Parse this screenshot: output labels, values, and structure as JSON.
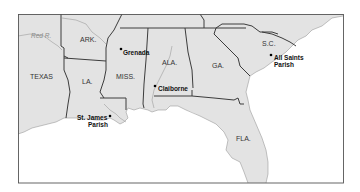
{
  "map": {
    "title": "",
    "states": [
      {
        "label": "TEXAS",
        "x": 30,
        "y": 79
      },
      {
        "label": "ARK.",
        "x": 80,
        "y": 42
      },
      {
        "label": "LA.",
        "x": 82,
        "y": 84
      },
      {
        "label": "MISS.",
        "x": 116,
        "y": 79
      },
      {
        "label": "ALA.",
        "x": 162,
        "y": 65
      },
      {
        "label": "GA.",
        "x": 212,
        "y": 68
      },
      {
        "label": "S.C.",
        "x": 272,
        "y": 46
      },
      {
        "label": "FLA.",
        "x": 236,
        "y": 141
      }
    ],
    "rivers": [
      {
        "label": "Red R.",
        "x": 31,
        "y": 38
      }
    ],
    "places": [
      {
        "label": "Grenada",
        "x": 123,
        "y": 55,
        "dot_x": 121,
        "dot_y": 49
      },
      {
        "label": "Claiborne",
        "x": 158,
        "y": 91,
        "dot_x": 155,
        "dot_y": 86
      },
      {
        "label_line1": "St. James",
        "label_line2": "Parish",
        "x1": 77,
        "y1": 120,
        "x2": 88,
        "y2": 127,
        "dot_x": 110,
        "dot_y": 116
      },
      {
        "label_line1": "All Saints",
        "label_line2": "Parish",
        "x1": 274,
        "y1": 60,
        "x2": 274,
        "y2": 67,
        "dot_x": 271,
        "dot_y": 55
      }
    ],
    "colors": {
      "land": "#e3e3e3",
      "water": "#ffffff",
      "border": "#3c3c3c",
      "frame": "#555555"
    }
  }
}
